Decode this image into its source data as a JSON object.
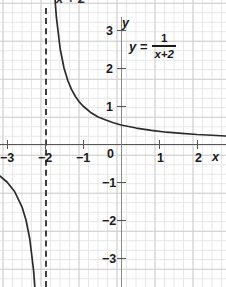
{
  "top_caption": "x + 2",
  "equation": {
    "lhs": "y =",
    "numerator": "1",
    "denominator": "x+2"
  },
  "axes": {
    "x_name": "x",
    "y_name": "y",
    "origin_label": "0"
  },
  "chart_data": {
    "type": "line",
    "title": "",
    "subtitle": "",
    "xlabel": "x",
    "ylabel": "y",
    "xlim": [
      -3.2,
      2.75
    ],
    "ylim": [
      -3.35,
      3.4
    ],
    "grid": true,
    "grid_minor_step": 0.25,
    "grid_major_step": 1,
    "legend": "none",
    "function": "y = 1/(x+2)",
    "asymptotes": {
      "vertical": [
        -2
      ],
      "horizontal": [
        0
      ]
    },
    "annotations": [
      {
        "text": "y = 1/(x+2)",
        "x": 0.5,
        "y": 2.7
      }
    ],
    "xticks": [
      -3,
      -2,
      -1,
      0,
      1,
      2
    ],
    "xticklabels": [
      "−3",
      "−2",
      "−1",
      "0",
      "1",
      "2"
    ],
    "yticks": [
      3,
      2,
      1,
      -1,
      -2,
      -3
    ],
    "yticklabels": [
      "3",
      "2",
      "1",
      "−1",
      "−2",
      "−3"
    ],
    "series": [
      {
        "name": "right-branch",
        "x": [
          -1.93,
          -1.9,
          -1.85,
          -1.8,
          -1.75,
          -1.7,
          -1.6,
          -1.5,
          -1.4,
          -1.3,
          -1.2,
          -1.1,
          -1.0,
          -0.8,
          -0.6,
          -0.4,
          -0.2,
          0.0,
          0.4,
          0.8,
          1.2,
          1.6,
          2.0,
          2.4,
          2.75
        ],
        "y": [
          14.29,
          10.0,
          6.67,
          5.0,
          4.0,
          3.33,
          2.5,
          2.0,
          1.67,
          1.43,
          1.25,
          1.11,
          1.0,
          0.83,
          0.71,
          0.63,
          0.56,
          0.5,
          0.42,
          0.36,
          0.31,
          0.28,
          0.25,
          0.23,
          0.21
        ]
      },
      {
        "name": "left-branch",
        "x": [
          -3.2,
          -3.0,
          -2.8,
          -2.6,
          -2.5,
          -2.4,
          -2.3,
          -2.25,
          -2.2,
          -2.15,
          -2.1,
          -2.08
        ],
        "y": [
          -0.83,
          -1.0,
          -1.25,
          -1.67,
          -2.0,
          -2.5,
          -3.33,
          -4.0,
          -5.0,
          -6.67,
          -10.0,
          -12.5
        ]
      }
    ]
  }
}
